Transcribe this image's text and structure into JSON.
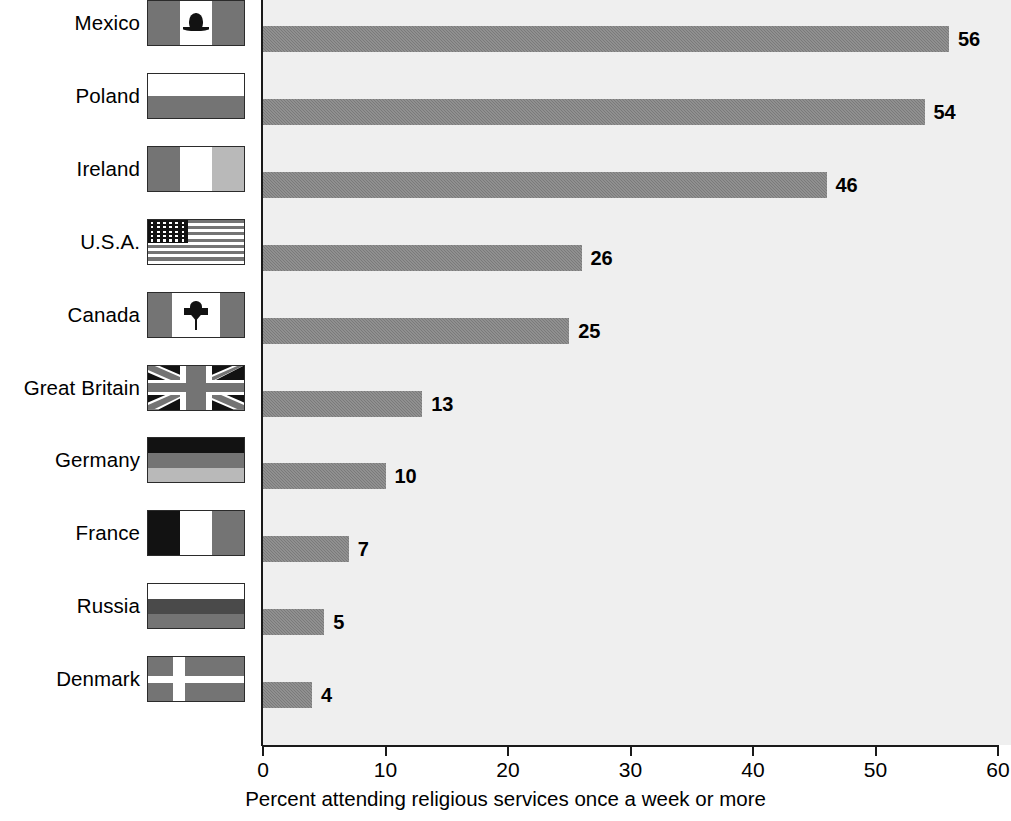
{
  "chart_data": {
    "type": "bar",
    "orientation": "horizontal",
    "title": "",
    "subtitle": "",
    "xlabel": "Percent attending religious services once a week or more",
    "ylabel": "",
    "xlim": [
      0,
      60
    ],
    "xticks": [
      0,
      10,
      20,
      30,
      40,
      50,
      60
    ],
    "grid": false,
    "legend": null,
    "bar_color": "#818181",
    "plot_background": "#efefef",
    "axis_color": "#1a1a1a",
    "categories": [
      "Mexico",
      "Poland",
      "Ireland",
      "U.S.A.",
      "Canada",
      "Great Britain",
      "Germany",
      "France",
      "Russia",
      "Denmark"
    ],
    "values": [
      56,
      54,
      46,
      26,
      25,
      13,
      10,
      7,
      5,
      4
    ],
    "data_labels": [
      "56",
      "54",
      "46",
      "26",
      "25",
      "13",
      "10",
      "7",
      "5",
      "4"
    ],
    "rows": [
      {
        "label": "Mexico",
        "value": 56,
        "data_label": "56",
        "flag": "flag-mexico-icon"
      },
      {
        "label": "Poland",
        "value": 54,
        "data_label": "54",
        "flag": "flag-poland-icon"
      },
      {
        "label": "Ireland",
        "value": 46,
        "data_label": "46",
        "flag": "flag-ireland-icon"
      },
      {
        "label": "U.S.A.",
        "value": 26,
        "data_label": "26",
        "flag": "flag-usa-icon"
      },
      {
        "label": "Canada",
        "value": 25,
        "data_label": "25",
        "flag": "flag-canada-icon"
      },
      {
        "label": "Great Britain",
        "value": 13,
        "data_label": "13",
        "flag": "flag-great-britain-icon"
      },
      {
        "label": "Germany",
        "value": 10,
        "data_label": "10",
        "flag": "flag-germany-icon"
      },
      {
        "label": "France",
        "value": 7,
        "data_label": "7",
        "flag": "flag-france-icon"
      },
      {
        "label": "Russia",
        "value": 5,
        "data_label": "5",
        "flag": "flag-russia-icon"
      },
      {
        "label": "Denmark",
        "value": 4,
        "data_label": "4",
        "flag": "flag-denmark-icon"
      }
    ]
  },
  "axis": {
    "tick_labels": [
      "0",
      "10",
      "20",
      "30",
      "40",
      "50",
      "60"
    ],
    "title": "Percent attending religious services once a week or more"
  }
}
